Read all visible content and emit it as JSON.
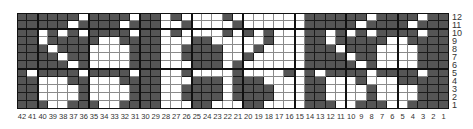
{
  "colors": {
    "dark": "#555555",
    "light": "#ffffff",
    "grid": "#1a1a1a"
  },
  "grid": {
    "columns": 42,
    "rows": 12,
    "column_labels": [
      42,
      41,
      40,
      39,
      38,
      37,
      36,
      35,
      34,
      33,
      32,
      31,
      30,
      29,
      28,
      27,
      26,
      25,
      24,
      23,
      22,
      21,
      20,
      19,
      18,
      17,
      16,
      15,
      14,
      13,
      12,
      11,
      10,
      9,
      8,
      7,
      6,
      5,
      4,
      3,
      2,
      1
    ],
    "row_labels": [
      12,
      11,
      10,
      9,
      8,
      7,
      6,
      5,
      4,
      3,
      2,
      1
    ],
    "group_size": 5,
    "pattern_rows_top_to_bottom": [
      "DDDDDDLDDDDLDDLDLLLLDLLLLLLLDDDDDDLDDDDLDD",
      "DDDDDLDDDDLDDDLLDLLLLDLLLLLLDDDDDLDDDDLDDD",
      "DDLDLDLDDDDLDDLDLLLLDLDLDLLLDDLDLDLDDDDLDD",
      "DDLDDDDDLLDDDDLLLDDLLLLLDLLLDDLDDDDDLLDDDD",
      "DDDLDDDLLLLDDDLLDDDDLLLDLLLLDDDLDDDLLLLDDD",
      "DDDDLDDLLLLDDDLLDDDDLLDLLLLLDDDDLDDLLLLDDD",
      "DDDDDLDLLLLDDDLLLDDDLDLLLLLLDDDDDLDLLLLDDD",
      "DLDDDDLDDDDLDDLLDLLLLDLLLLDLDLDDDDLDDDDLDD",
      "DDLLLDDLLLDDDDLLLDDDLDDDLLLLDDLLLDLLLDDDDD",
      "DDLLLLDLLLLDDDLLDDDDLDDDDLLLDDLLLLDLLLLDDD",
      "DDLLLLDLLLLDDDLLDDDDLDDDDLLLDDLLLLDLLLLDDD",
      "DDDLLDDDLLDDDDLLLDDLLLDDLLLLDDDLLDDDLLDDDD"
    ]
  }
}
